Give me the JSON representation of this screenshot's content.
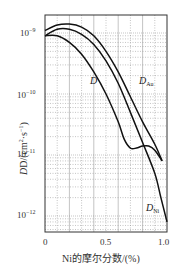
{
  "chart_data": {
    "type": "line",
    "title": "",
    "xlabel": "Ni的摩尔分数/(%)",
    "ylabel": "D/(cm²·s⁻¹)",
    "yscale": "log",
    "xlim": [
      0,
      1.0
    ],
    "ylim": [
      5e-13,
      3e-09
    ],
    "x_ticks": [
      "0",
      "0.5",
      "1.0"
    ],
    "y_ticks": [
      "10⁻⁹",
      "10⁻¹⁰",
      "10⁻¹¹",
      "10⁻¹²"
    ],
    "grid": true,
    "series": [
      {
        "name": "D_Au",
        "label": "D",
        "label_sub": "Au",
        "x": [
          0,
          0.1,
          0.2,
          0.3,
          0.4,
          0.5,
          0.6,
          0.7,
          0.8,
          0.9,
          0.96
        ],
        "y": [
          1.1e-09,
          1.35e-09,
          1.4e-09,
          1.25e-09,
          9e-10,
          5e-10,
          2.3e-10,
          9e-11,
          3.5e-11,
          1.5e-11,
          8e-12
        ]
      },
      {
        "name": "D_Ni",
        "label": "D",
        "label_sub": "Ni",
        "x": [
          0,
          0.1,
          0.2,
          0.3,
          0.4,
          0.5,
          0.6,
          0.7,
          0.8,
          0.9,
          0.95,
          1.0
        ],
        "y": [
          9e-10,
          1.15e-09,
          1.15e-09,
          9.5e-10,
          6.5e-10,
          3.5e-10,
          1.5e-10,
          5e-11,
          1.6e-11,
          5e-12,
          2e-12,
          8e-13
        ]
      },
      {
        "name": "D",
        "label": "D",
        "label_sub": "",
        "x": [
          0,
          0.1,
          0.2,
          0.3,
          0.4,
          0.5,
          0.6,
          0.65,
          0.7,
          0.75,
          0.8,
          0.85,
          0.9,
          0.96
        ],
        "y": [
          9e-10,
          9e-10,
          7e-10,
          4.5e-10,
          2.3e-10,
          1e-10,
          3.5e-11,
          1.8e-11,
          1.3e-11,
          1.3e-11,
          1.4e-11,
          1.4e-11,
          1.2e-11,
          8e-12
        ]
      }
    ]
  },
  "labels": {
    "x_axis": "Ni的摩尔分数/(%)",
    "y_axis_main": "D/(cm",
    "y_axis_tail": "·s",
    "x_ticks": [
      "0",
      "0.5",
      "1.0"
    ],
    "y_ticks": [
      "10",
      "10",
      "10",
      "10"
    ],
    "y_exps": [
      "−9",
      "−10",
      "−11",
      "−12"
    ],
    "curve_D": "D",
    "curve_DAu_main": "D",
    "curve_DAu_sub": "Au",
    "curve_DNi_main": "D",
    "curve_DNi_sub": "Ni"
  }
}
